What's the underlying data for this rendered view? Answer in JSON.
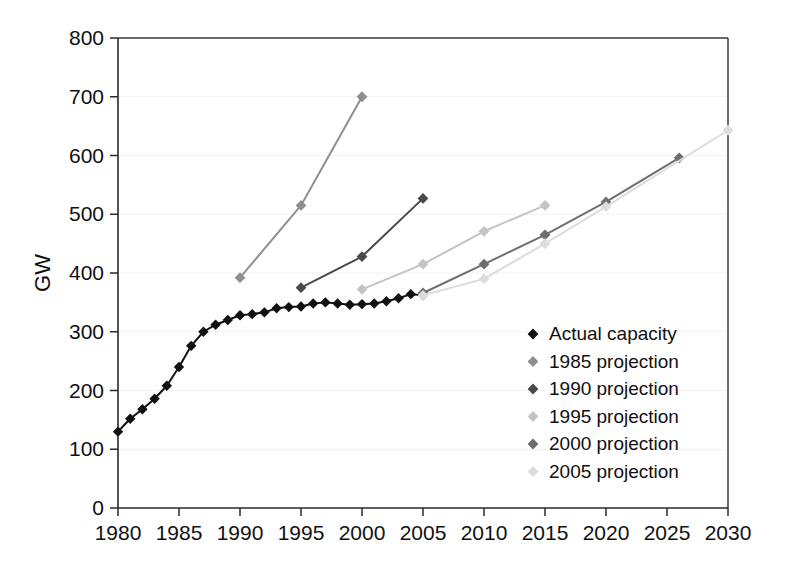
{
  "chart_data": {
    "type": "line",
    "title": "",
    "subtitle": "",
    "xlabel": "",
    "ylabel": "GW",
    "xlim": [
      1980,
      2030
    ],
    "ylim": [
      0,
      800
    ],
    "xticks": [
      1980,
      1985,
      1990,
      1995,
      2000,
      2005,
      2010,
      2015,
      2020,
      2025,
      2030
    ],
    "yticks": [
      0,
      100,
      200,
      300,
      400,
      500,
      600,
      700,
      800
    ],
    "grid": "horizontal-faint",
    "legend_position": "center-right-inside",
    "marker": "diamond",
    "series": [
      {
        "name": "Actual capacity",
        "color": "#111111",
        "x": [
          1980,
          1981,
          1982,
          1983,
          1984,
          1985,
          1986,
          1987,
          1988,
          1989,
          1990,
          1991,
          1992,
          1993,
          1994,
          1995,
          1996,
          1997,
          1998,
          1999,
          2000,
          2001,
          2002,
          2003,
          2004,
          2005
        ],
        "values": [
          130,
          152,
          168,
          186,
          208,
          240,
          276,
          300,
          312,
          320,
          328,
          330,
          333,
          340,
          342,
          343,
          348,
          350,
          348,
          346,
          347,
          348,
          352,
          357,
          364,
          362
        ]
      },
      {
        "name": "1985 projection",
        "color": "#8f8f8f",
        "x": [
          1990,
          1995,
          2000
        ],
        "values": [
          392,
          515,
          700
        ]
      },
      {
        "name": "1990 projection",
        "color": "#4a4a4a",
        "x": [
          1995,
          2000,
          2005
        ],
        "values": [
          375,
          428,
          527
        ]
      },
      {
        "name": "1995 projection",
        "color": "#c4c4c4",
        "x": [
          2000,
          2005,
          2010,
          2015
        ],
        "values": [
          372,
          415,
          471,
          515
        ]
      },
      {
        "name": "2000 projection",
        "color": "#6e6e6e",
        "x": [
          2005,
          2010,
          2015,
          2020,
          2026
        ],
        "values": [
          366,
          415,
          465,
          521,
          596
        ]
      },
      {
        "name": "2005 projection",
        "color": "#dcdcdc",
        "x": [
          2005,
          2010,
          2015,
          2020,
          2030
        ],
        "values": [
          362,
          390,
          450,
          513,
          643
        ]
      }
    ]
  },
  "axes": {
    "y_axis_title": "GW",
    "y_tick_labels": [
      "800",
      "700",
      "600",
      "500",
      "400",
      "300",
      "200",
      "100",
      "0"
    ],
    "x_tick_labels": [
      "1980",
      "1985",
      "1990",
      "1995",
      "2000",
      "2005",
      "2010",
      "2015",
      "2020",
      "2025",
      "2030"
    ]
  },
  "legend": {
    "items": [
      {
        "label": "Actual capacity",
        "color": "#111111",
        "marker": "diamond-marker"
      },
      {
        "label": "1985 projection",
        "color": "#8f8f8f",
        "marker": "diamond-marker"
      },
      {
        "label": "1990 projection",
        "color": "#4a4a4a",
        "marker": "diamond-marker"
      },
      {
        "label": "1995 projection",
        "color": "#c4c4c4",
        "marker": "diamond-marker"
      },
      {
        "label": "2000 projection",
        "color": "#6e6e6e",
        "marker": "diamond-marker"
      },
      {
        "label": "2005 projection",
        "color": "#dcdcdc",
        "marker": "diamond-marker"
      }
    ]
  },
  "colors": {
    "background": "#ffffff",
    "axis": "#2b2b2b",
    "grid": "#f2f2f2",
    "text": "#101010"
  }
}
